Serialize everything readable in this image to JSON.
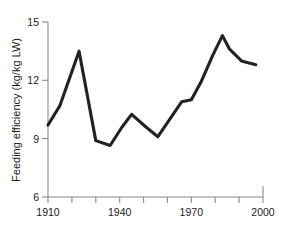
{
  "chart_data": {
    "type": "line",
    "title": "",
    "xlabel": "",
    "ylabel": "Feeding efficiency (kg/kg LW)",
    "xlim": [
      1910,
      2000
    ],
    "ylim": [
      6,
      15
    ],
    "grid": false,
    "legend": "none",
    "x_ticks": [
      1910,
      1920,
      1930,
      1940,
      1950,
      1960,
      1970,
      1980,
      1990,
      2000
    ],
    "x_tick_labels": [
      "1910",
      "",
      "",
      "1940",
      "",
      "",
      "1970",
      "",
      "",
      "2000"
    ],
    "y_ticks": [
      6,
      9,
      12,
      15
    ],
    "y_tick_labels": [
      "6",
      "9",
      "12",
      "15"
    ],
    "series": [
      {
        "name": "Feeding efficiency",
        "color": "#222222",
        "x": [
          1910,
          1915,
          1923,
          1930,
          1936,
          1941,
          1945,
          1951,
          1956,
          1961,
          1966,
          1970,
          1974,
          1979,
          1983,
          1986,
          1991,
          1997
        ],
        "values": [
          9.7,
          10.7,
          13.5,
          8.9,
          8.65,
          9.6,
          10.25,
          9.6,
          9.1,
          10.0,
          10.9,
          11.0,
          11.9,
          13.3,
          14.3,
          13.6,
          13.0,
          12.8
        ]
      }
    ]
  },
  "axis_labels": {
    "y_title": "Feeding efficiency (kg/kg LW)",
    "y_15": "15",
    "y_12": "12",
    "y_9": "9",
    "y_6": "6",
    "x_1910": "1910",
    "x_1940": "1940",
    "x_1970": "1970",
    "x_2000": "2000"
  },
  "colors": {
    "line": "#222222",
    "axis": "#8a8a8a",
    "text": "#1a1a1a",
    "background": "#ffffff"
  }
}
